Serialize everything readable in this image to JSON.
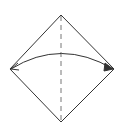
{
  "diagram": {
    "type": "origami-fold-step",
    "background": "#ffffff",
    "stroke_color": "#333333",
    "dashed_color": "#777777",
    "paper_square": {
      "shape": "diamond",
      "vertices": {
        "top": [
          61,
          15
        ],
        "right": [
          114,
          69
        ],
        "bottom": [
          61,
          122
        ],
        "left": [
          10,
          69
        ]
      }
    },
    "fold_line": {
      "style": "dashed",
      "kind": "valley-fold",
      "from": [
        61,
        15
      ],
      "to": [
        61,
        122
      ]
    },
    "arrow": {
      "kind": "curved-double-arrow",
      "from": [
        11,
        69
      ],
      "to": [
        113,
        69
      ],
      "control": [
        61,
        38
      ],
      "heads": [
        "left",
        "right"
      ]
    }
  }
}
